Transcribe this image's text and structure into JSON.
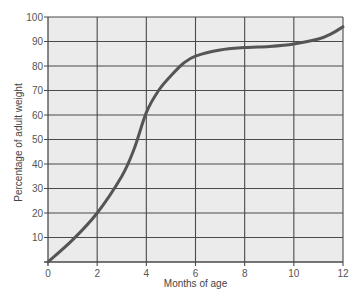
{
  "chart_data": {
    "type": "line",
    "title": "",
    "xlabel": "Months of age",
    "ylabel": "Percentage of adult weight",
    "xlim": [
      0,
      12
    ],
    "ylim": [
      0,
      100
    ],
    "x_ticks": [
      0,
      2,
      4,
      6,
      8,
      10,
      12
    ],
    "y_ticks": [
      10,
      20,
      30,
      40,
      50,
      60,
      70,
      80,
      90,
      100
    ],
    "x_tick_labels": [
      "0",
      "2",
      "4",
      "6",
      "8",
      "10",
      "12"
    ],
    "y_tick_labels": [
      "10",
      "20",
      "30",
      "40",
      "50",
      "60",
      "70",
      "80",
      "90",
      "100"
    ],
    "grid": true,
    "legend": "none",
    "colors": {
      "plot_background": "#ebebeb",
      "grid": "#4a4a4a",
      "line": "#555555"
    },
    "series": [
      {
        "name": "Percentage of adult weight",
        "x": [
          0,
          1,
          2,
          3,
          3.5,
          4,
          4.5,
          5,
          5.5,
          6,
          7,
          8,
          9,
          10,
          11,
          11.5,
          12
        ],
        "values": [
          0,
          9,
          20,
          35,
          46,
          61,
          70,
          76,
          81,
          84,
          86.5,
          87.5,
          88,
          89,
          91,
          93,
          96
        ]
      }
    ]
  }
}
